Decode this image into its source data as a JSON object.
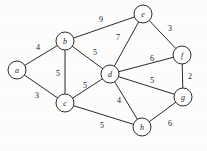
{
  "figure": {
    "kind": "undirected-weighted-graph",
    "background_color": "#fdfdfc",
    "stroke_color": "#2b2b2b",
    "text_color": "#1a1a1a"
  },
  "chart_data": {
    "type": "diagram",
    "title": "",
    "xlabel": "",
    "ylabel": "",
    "graph_type": "undirected weighted graph",
    "node_radius": 9,
    "nodes": [
      {
        "id": "a",
        "label": "a",
        "x": 17,
        "y": 70
      },
      {
        "id": "b",
        "label": "b",
        "x": 65,
        "y": 41
      },
      {
        "id": "c",
        "label": "c",
        "x": 65,
        "y": 103
      },
      {
        "id": "d",
        "label": "d",
        "x": 110,
        "y": 74
      },
      {
        "id": "e",
        "label": "e",
        "x": 143,
        "y": 14
      },
      {
        "id": "f",
        "label": "f",
        "x": 182,
        "y": 55
      },
      {
        "id": "g",
        "label": "g",
        "x": 183,
        "y": 97
      },
      {
        "id": "h",
        "label": "h",
        "x": 142,
        "y": 127
      }
    ],
    "edges": [
      {
        "source": "a",
        "target": "b",
        "weight": 4,
        "label_x": 38,
        "label_y": 47
      },
      {
        "source": "a",
        "target": "c",
        "weight": 3,
        "label_x": 37,
        "label_y": 95
      },
      {
        "source": "b",
        "target": "c",
        "weight": 5,
        "label_x": 58,
        "label_y": 73
      },
      {
        "source": "b",
        "target": "d",
        "weight": 5,
        "label_x": 95,
        "label_y": 52
      },
      {
        "source": "b",
        "target": "e",
        "weight": 9,
        "label_x": 101,
        "label_y": 19
      },
      {
        "source": "c",
        "target": "d",
        "weight": 5,
        "label_x": 85,
        "label_y": 85
      },
      {
        "source": "c",
        "target": "h",
        "weight": 5,
        "label_x": 102,
        "label_y": 125
      },
      {
        "source": "d",
        "target": "e",
        "weight": 7,
        "label_x": 118,
        "label_y": 37
      },
      {
        "source": "d",
        "target": "f",
        "weight": 6,
        "label_x": 152,
        "label_y": 58
      },
      {
        "source": "d",
        "target": "g",
        "weight": 5,
        "label_x": 152,
        "label_y": 80
      },
      {
        "source": "d",
        "target": "h",
        "weight": 4,
        "label_x": 119,
        "label_y": 100
      },
      {
        "source": "e",
        "target": "f",
        "weight": 3,
        "label_x": 170,
        "label_y": 28
      },
      {
        "source": "f",
        "target": "g",
        "weight": 2,
        "label_x": 190,
        "label_y": 76
      },
      {
        "source": "g",
        "target": "h",
        "weight": 6,
        "label_x": 170,
        "label_y": 123
      }
    ]
  }
}
